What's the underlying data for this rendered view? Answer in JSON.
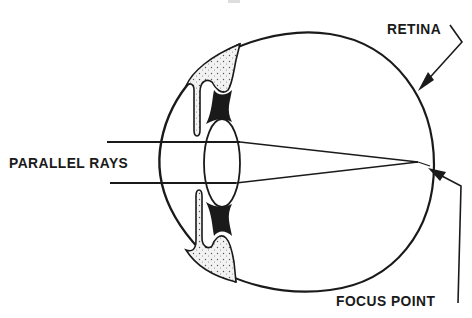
{
  "diagram": {
    "labels": {
      "parallel_rays": "PARALLEL RAYS",
      "retina": "RETINA",
      "focus_point": "FOCUS POINT"
    },
    "parts": [
      "cornea",
      "iris",
      "ciliary-body",
      "lens",
      "eyeball",
      "retina",
      "light-rays",
      "focus-point"
    ],
    "colors": {
      "line": "#1a1a1a",
      "background": "#ffffff",
      "stipple": "#e6e6e6"
    }
  }
}
